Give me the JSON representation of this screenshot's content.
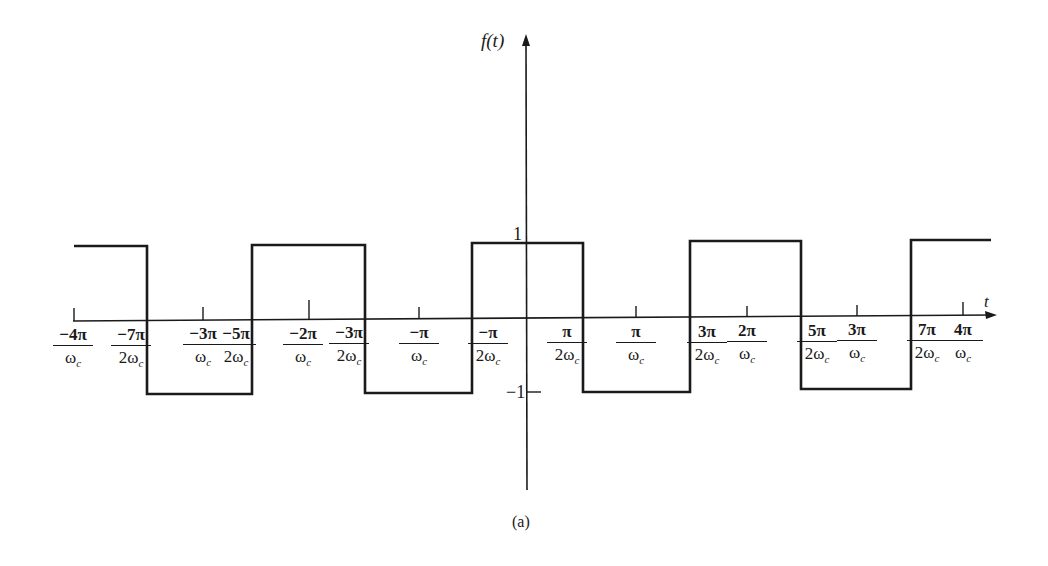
{
  "figure": {
    "caption": "(a)",
    "y_axis_label": "f(t)",
    "x_axis_label": "t",
    "y_tick_pos": "1",
    "y_tick_neg": "−1"
  },
  "x_labels": [
    {
      "num": "−4π",
      "den": "ω",
      "sub": "c",
      "x": 73
    },
    {
      "num": "−7π",
      "den": "2ω",
      "sub": "c",
      "x": 131
    },
    {
      "num": "−3π",
      "den": "ω",
      "sub": "c",
      "x": 203
    },
    {
      "num": "−5π",
      "den": "2ω",
      "sub": "c",
      "x": 236
    },
    {
      "num": "−2π",
      "den": "ω",
      "sub": "c",
      "x": 303
    },
    {
      "num": "−3π",
      "den": "2ω",
      "sub": "c",
      "x": 349
    },
    {
      "num": "−π",
      "den": "ω",
      "sub": "c",
      "x": 419
    },
    {
      "num": "−π",
      "den": "2ω",
      "sub": "c",
      "x": 488
    },
    {
      "num": "π",
      "den": "2ω",
      "sub": "c",
      "x": 567
    },
    {
      "num": "π",
      "den": "ω",
      "sub": "c",
      "x": 636
    },
    {
      "num": "3π",
      "den": "2ω",
      "sub": "c",
      "x": 707
    },
    {
      "num": "2π",
      "den": "ω",
      "sub": "c",
      "x": 747
    },
    {
      "num": "5π",
      "den": "2ω",
      "sub": "c",
      "x": 817
    },
    {
      "num": "3π",
      "den": "ω",
      "sub": "c",
      "x": 857
    },
    {
      "num": "7π",
      "den": "2ω",
      "sub": "c",
      "x": 927
    },
    {
      "num": "4π",
      "den": "ω",
      "sub": "c",
      "x": 963
    }
  ],
  "chart_data": {
    "type": "line",
    "title": "",
    "caption": "(a)",
    "xlabel": "t",
    "ylabel": "f(t)",
    "x_unit": "π/ωc",
    "x": [
      -4.0,
      -3.5,
      -3.5,
      -2.5,
      -2.5,
      -1.5,
      -1.5,
      -0.5,
      -0.5,
      0.5,
      0.5,
      1.5,
      1.5,
      2.5,
      2.5,
      3.5,
      3.5,
      4.0
    ],
    "y": [
      1,
      1,
      -1,
      -1,
      1,
      1,
      -1,
      -1,
      1,
      1,
      -1,
      -1,
      1,
      1,
      -1,
      -1,
      1,
      1
    ],
    "xlim": [
      -4,
      4
    ],
    "ylim": [
      -1,
      1
    ],
    "x_tick_labels": [
      "−4π/ωc",
      "−7π/2ωc",
      "−3π/ωc",
      "−5π/2ωc",
      "−2π/ωc",
      "−3π/2ωc",
      "−π/ωc",
      "−π/2ωc",
      "π/2ωc",
      "π/ωc",
      "3π/2ωc",
      "2π/ωc",
      "5π/2ωc",
      "3π/ωc",
      "7π/2ωc",
      "4π/ωc"
    ],
    "y_tick_labels": [
      "1",
      "−1"
    ],
    "grid": false,
    "legend": null
  }
}
